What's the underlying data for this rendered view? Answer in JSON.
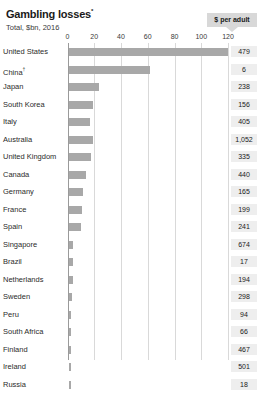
{
  "header": {
    "title": "Gambling losses",
    "title_superscript": "*",
    "subtitle": "Total, $bn, 2016"
  },
  "badge": {
    "label": "$ per adult"
  },
  "chart_data": {
    "type": "bar",
    "title": "Gambling losses",
    "subtitle": "Total, $bn, 2016",
    "xlabel": "",
    "ylabel": "",
    "orientation": "horizontal",
    "xlim": [
      0,
      125
    ],
    "grid": true,
    "legend": null,
    "tick_labels": [
      "0",
      "20",
      "40",
      "60",
      "80",
      "100",
      "120"
    ],
    "ticks": [
      0,
      20,
      40,
      60,
      80,
      100,
      120
    ],
    "value_column_header": "$ per adult",
    "categories": [
      "United States",
      "China",
      "Japan",
      "South Korea",
      "Italy",
      "Australia",
      "United Kingdom",
      "Canada",
      "Germany",
      "France",
      "Spain",
      "Singapore",
      "Brazil",
      "Netherlands",
      "Sweden",
      "Peru",
      "South Africa",
      "Finland",
      "Ireland",
      "Russia"
    ],
    "category_superscripts": [
      "",
      "†",
      "",
      "",
      "",
      "",
      "",
      "",
      "",
      "",
      "",
      "",
      "",
      "",
      "",
      "",
      "",
      "",
      "",
      ""
    ],
    "values": [
      119,
      61,
      23,
      18,
      16,
      18,
      17,
      13,
      11,
      10,
      9,
      3,
      3,
      3,
      2.5,
      2,
      2,
      2,
      1.8,
      1.7
    ],
    "per_adult": [
      "479",
      "6",
      "238",
      "156",
      "405",
      "1,052",
      "335",
      "440",
      "165",
      "199",
      "241",
      "674",
      "17",
      "194",
      "298",
      "94",
      "66",
      "467",
      "501",
      "18"
    ]
  }
}
